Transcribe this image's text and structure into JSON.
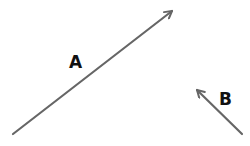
{
  "diagram": {
    "type": "vectors",
    "stroke_color": "#666666",
    "label_color": "#111111",
    "vectors": [
      {
        "label": "A",
        "from": [
          13,
          134
        ],
        "to": [
          172,
          11
        ],
        "label_pos": [
          69,
          54
        ]
      },
      {
        "label": "B",
        "from": [
          242,
          134
        ],
        "to": [
          197,
          90
        ],
        "label_pos": [
          219,
          91
        ]
      }
    ]
  }
}
